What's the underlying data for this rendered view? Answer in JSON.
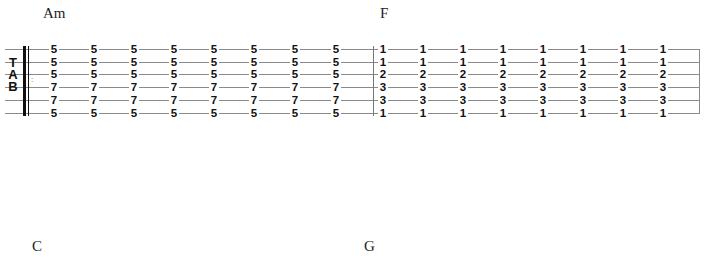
{
  "chords": [
    {
      "name": "Am",
      "x": 43,
      "y": 5
    },
    {
      "name": "F",
      "x": 380,
      "y": 5
    },
    {
      "name": "C",
      "x": 32,
      "y": 238
    },
    {
      "name": "G",
      "x": 364,
      "y": 238
    }
  ],
  "staff": {
    "clef_label": [
      "T",
      "A",
      "B"
    ],
    "repeat_dots": ":",
    "string_count": 6
  },
  "measures": [
    {
      "chord": "Am",
      "column_x": [
        54,
        94,
        134,
        174,
        214,
        254,
        295,
        336
      ],
      "frets": [
        "5",
        "5",
        "5",
        "7",
        "7",
        "5"
      ]
    },
    {
      "chord": "F",
      "column_x": [
        383,
        423,
        463,
        503,
        543,
        583,
        623,
        663
      ],
      "frets": [
        "1",
        "1",
        "2",
        "3",
        "3",
        "1"
      ]
    }
  ]
}
